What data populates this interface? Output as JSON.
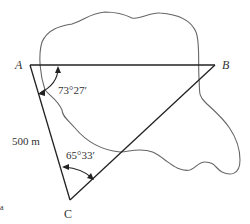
{
  "diagram": {
    "points": {
      "A": {
        "label": "A",
        "x": 30,
        "y": 65
      },
      "B": {
        "label": "B",
        "x": 215,
        "y": 65
      },
      "C": {
        "label": "C",
        "x": 70,
        "y": 200
      }
    },
    "side_AC_label": "500 m",
    "angle_A_label": "73°27′",
    "angle_C_label": "65°33′",
    "corner_mark": "a",
    "colors": {
      "line": "#222222",
      "outline": "#666666",
      "text": "#333333"
    }
  }
}
